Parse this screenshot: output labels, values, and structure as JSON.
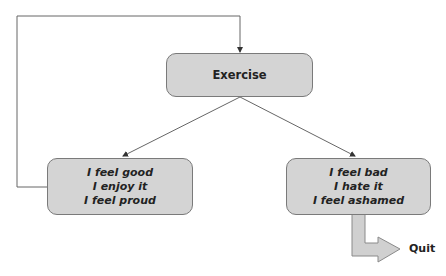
{
  "diagram": {
    "type": "flowchart",
    "nodes": {
      "exercise": {
        "lines": [
          "Exercise"
        ]
      },
      "positive": {
        "lines": [
          "I feel good",
          "I enjoy it",
          "I feel proud"
        ]
      },
      "negative": {
        "lines": [
          "I feel bad",
          "I hate it",
          "I feel ashamed"
        ]
      }
    },
    "exit_label": "Quit",
    "edges": [
      {
        "from": "exercise",
        "to": "positive"
      },
      {
        "from": "exercise",
        "to": "negative"
      },
      {
        "from": "positive",
        "to": "exercise",
        "kind": "loop-back"
      },
      {
        "from": "negative",
        "to": "Quit",
        "kind": "exit-arrow"
      }
    ],
    "colors": {
      "node_fill": "#d4d4d4",
      "node_border": "#7a7a7a",
      "line": "#555555",
      "text": "#222222"
    }
  }
}
